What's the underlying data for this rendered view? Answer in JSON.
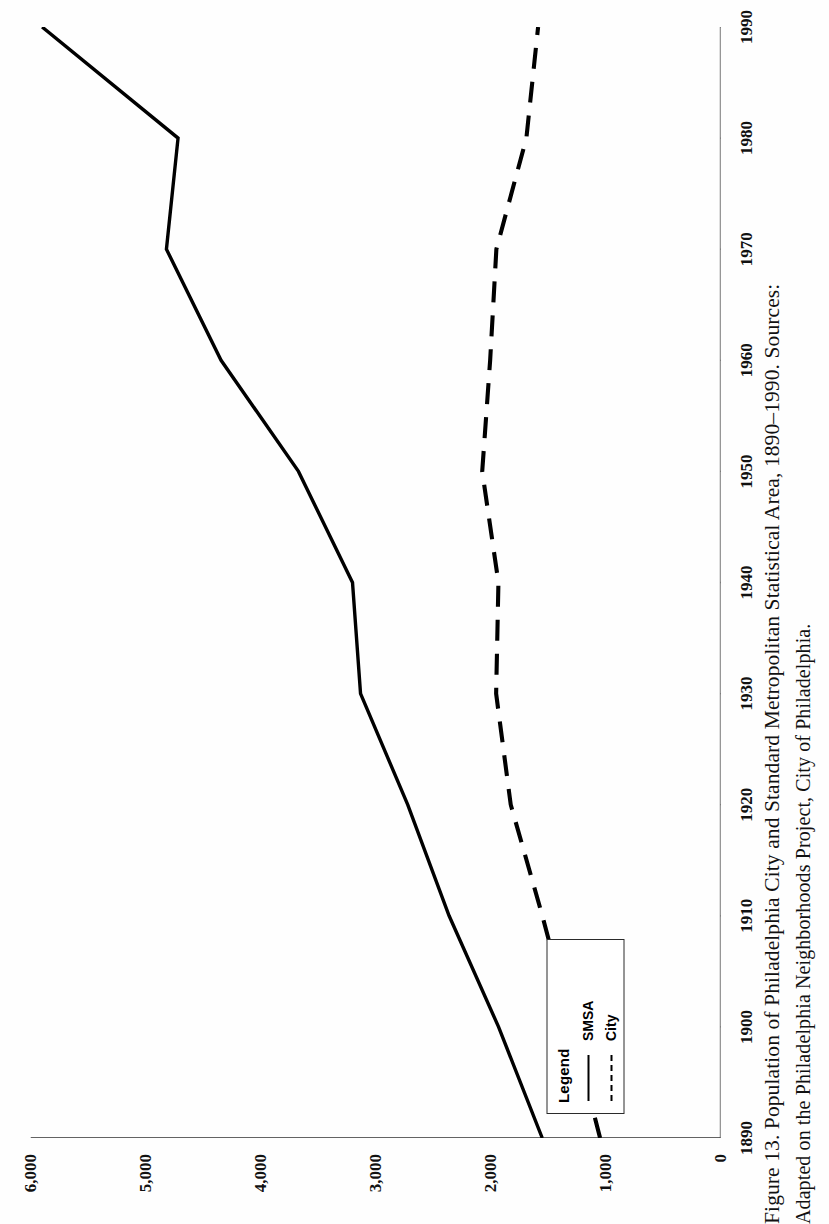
{
  "figure": {
    "caption_line1": "Figure 13. Population of Philadelphia City and Standard Metropolitan Statistical Area, 1890–1990. Sources:",
    "caption_line2": "Adapted  on the Philadelphia Neighborhoods Project, City of Philadelphia."
  },
  "legend": {
    "title": "Legend",
    "items": [
      {
        "label": "SMSA",
        "style": "solid",
        "name": "legend-item-smsa"
      },
      {
        "label": "City",
        "style": "dashed",
        "name": "legend-item-city"
      }
    ]
  },
  "axes": {
    "x_ticks": [
      "1890",
      "1900",
      "1910",
      "1920",
      "1930",
      "1940",
      "1950",
      "1960",
      "1970",
      "1980",
      "1990"
    ],
    "y_ticks": [
      "0",
      "1,000",
      "2,000",
      "3,000",
      "4,000",
      "5,000",
      "6,000"
    ]
  },
  "chart_data": {
    "type": "line",
    "title": "Population of Philadelphia City and Standard Metropolitan Statistical Area, 1890–1990",
    "xlabel": "",
    "ylabel": "",
    "xlim": [
      1890,
      1990
    ],
    "ylim": [
      0,
      6000
    ],
    "grid": false,
    "legend_position": "bottom-left",
    "orientation": "page-rotated-90",
    "units": "thousands of persons",
    "categories": [
      1890,
      1900,
      1910,
      1920,
      1930,
      1940,
      1950,
      1960,
      1970,
      1980,
      1990
    ],
    "series": [
      {
        "name": "SMSA",
        "style": "solid",
        "values": [
          1550,
          1930,
          2360,
          2720,
          3130,
          3200,
          3670,
          4343,
          4818,
          4717,
          5899
        ]
      },
      {
        "name": "City",
        "style": "dashed",
        "values": [
          1047,
          1294,
          1549,
          1824,
          1951,
          1931,
          2072,
          2003,
          1949,
          1688,
          1586
        ]
      }
    ]
  }
}
